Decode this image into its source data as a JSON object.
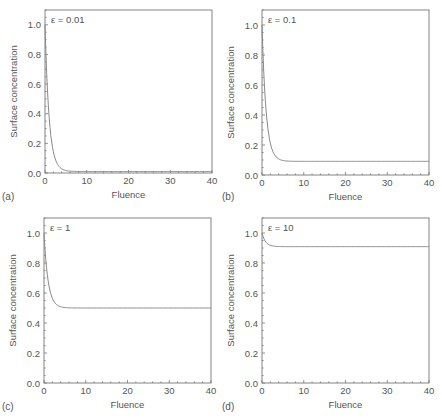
{
  "figure": {
    "panels_label": [
      "(a)",
      "(b)",
      "(c)",
      "(d)"
    ]
  },
  "chart_data": [
    {
      "type": "line",
      "panel": "(a)",
      "annotation": "ε = 0.01",
      "epsilon": 0.01,
      "xlabel": "Fluence",
      "ylabel": "Surface concentration",
      "xlim": [
        0,
        40
      ],
      "ylim": [
        0,
        1.1
      ],
      "xticks": [
        0,
        10,
        20,
        30,
        40
      ],
      "yticks": [
        "0.0",
        "0.2",
        "0.4",
        "0.6",
        "0.8",
        "1.0"
      ],
      "grid": false,
      "series": [
        {
          "name": "surface concentration",
          "x": [
            0,
            0.5,
            1,
            1.5,
            2,
            3,
            4,
            5,
            6,
            8,
            10,
            20,
            30,
            40
          ],
          "y": [
            1.0,
            0.61,
            0.37,
            0.23,
            0.14,
            0.05,
            0.02,
            0.01,
            0.01,
            0.01,
            0.01,
            0.01,
            0.01,
            0.01
          ]
        }
      ]
    },
    {
      "type": "line",
      "panel": "(b)",
      "annotation": "ε = 0.1",
      "epsilon": 0.1,
      "xlabel": "Fluence",
      "ylabel": "Surface concentration",
      "xlim": [
        0,
        40
      ],
      "ylim": [
        0,
        1.1
      ],
      "xticks": [
        0,
        10,
        20,
        30,
        40
      ],
      "yticks": [
        "0.0",
        "0.2",
        "0.4",
        "0.6",
        "0.8",
        "1.0"
      ],
      "grid": false,
      "series": [
        {
          "name": "surface concentration",
          "x": [
            0,
            0.5,
            1,
            1.5,
            2,
            3,
            4,
            5,
            6,
            8,
            10,
            20,
            30,
            40
          ],
          "y": [
            1.0,
            0.64,
            0.42,
            0.29,
            0.21,
            0.13,
            0.105,
            0.095,
            0.092,
            0.091,
            0.091,
            0.091,
            0.091,
            0.091
          ]
        }
      ]
    },
    {
      "type": "line",
      "panel": "(c)",
      "annotation": "ε = 1",
      "epsilon": 1,
      "xlabel": "Fluence",
      "ylabel": "Surface concentration",
      "xlim": [
        0,
        40
      ],
      "ylim": [
        0,
        1.1
      ],
      "xticks": [
        0,
        10,
        20,
        30,
        40
      ],
      "yticks": [
        "0.0",
        "0.2",
        "0.4",
        "0.6",
        "0.8",
        "1.0"
      ],
      "grid": false,
      "series": [
        {
          "name": "surface concentration",
          "x": [
            0,
            0.5,
            1,
            1.5,
            2,
            3,
            4,
            5,
            6,
            8,
            10,
            20,
            30,
            40
          ],
          "y": [
            1.0,
            0.8,
            0.68,
            0.6,
            0.56,
            0.52,
            0.505,
            0.5,
            0.5,
            0.5,
            0.5,
            0.5,
            0.5,
            0.5
          ]
        }
      ]
    },
    {
      "type": "line",
      "panel": "(d)",
      "annotation": "ε = 10",
      "epsilon": 10,
      "xlabel": "Fluence",
      "ylabel": "Surface concentration",
      "xlim": [
        0,
        40
      ],
      "ylim": [
        0,
        1.1
      ],
      "xticks": [
        0,
        10,
        20,
        30,
        40
      ],
      "yticks": [
        "0.0",
        "0.2",
        "0.4",
        "0.6",
        "0.8",
        "1.0"
      ],
      "grid": false,
      "series": [
        {
          "name": "surface concentration",
          "x": [
            0,
            0.5,
            1,
            1.5,
            2,
            3,
            4,
            5,
            6,
            8,
            10,
            20,
            30,
            40
          ],
          "y": [
            1.0,
            0.96,
            0.935,
            0.92,
            0.915,
            0.911,
            0.909,
            0.909,
            0.909,
            0.909,
            0.909,
            0.909,
            0.909,
            0.909
          ]
        }
      ]
    }
  ]
}
